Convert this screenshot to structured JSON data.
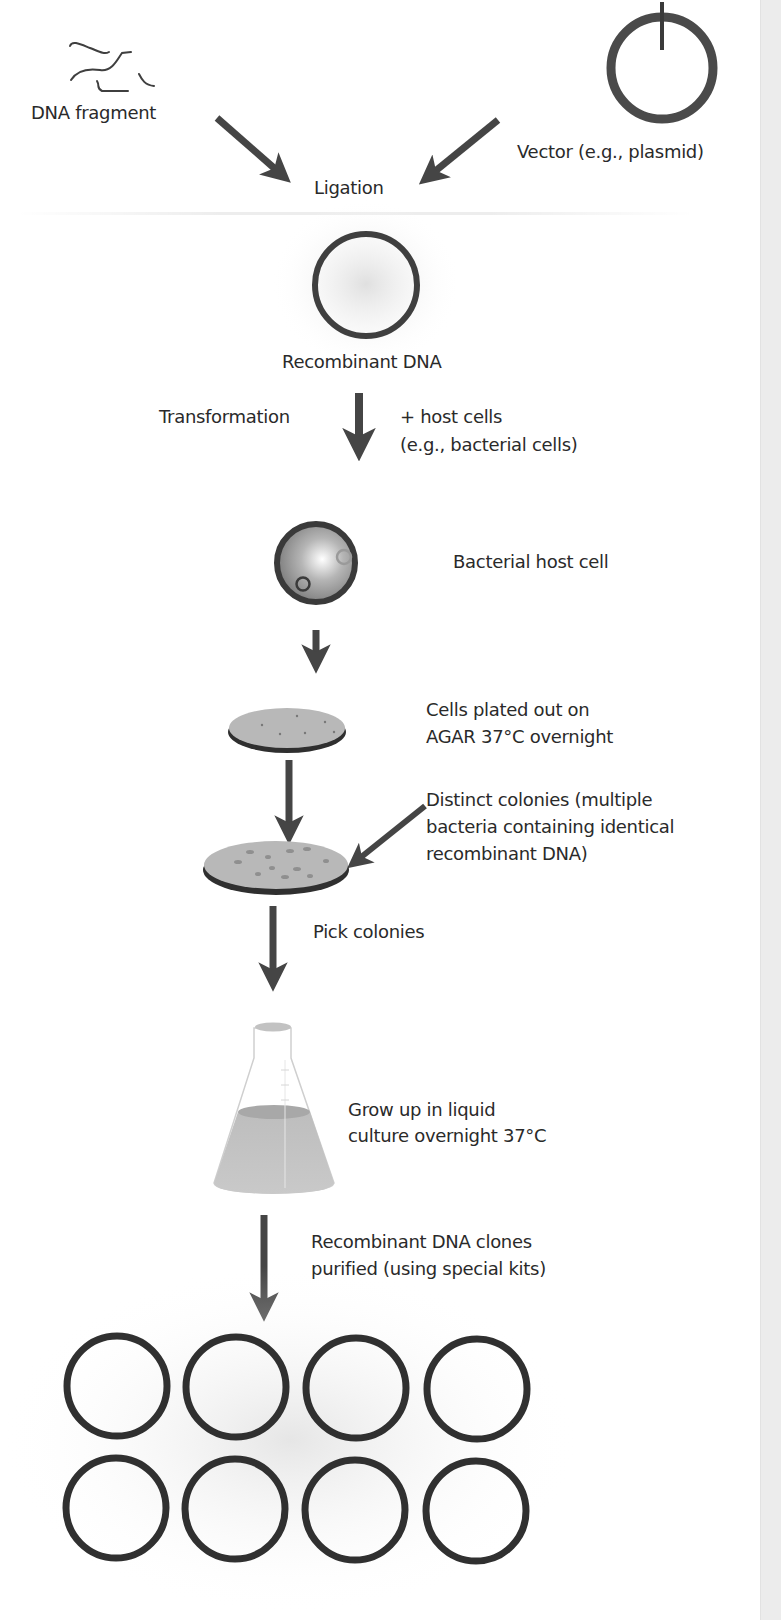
{
  "diagram": {
    "colors": {
      "stroke": "#3f3f3f",
      "arrow": "#454545",
      "agar": "#b8b8b8",
      "liquid": "#c4c4c4",
      "side_band": "#ececec"
    },
    "inputs": {
      "dna_fragment": "DNA fragment",
      "vector": "Vector (e.g., plasmid)"
    },
    "steps": [
      {
        "id": "ligation",
        "label": "Ligation"
      },
      {
        "id": "recombinant_dna",
        "label": "Recombinant DNA"
      },
      {
        "id": "transformation",
        "label": "Transformation",
        "note_line1": "+ host cells",
        "note_line2": "(e.g., bacterial cells)"
      },
      {
        "id": "host_cell",
        "label": "Bacterial host cell"
      },
      {
        "id": "plating",
        "line1": "Cells plated out on",
        "line2": "AGAR 37°C overnight"
      },
      {
        "id": "colonies",
        "line1": "Distinct colonies (multiple",
        "line2": "bacteria containing identical",
        "line3": "recombinant DNA)"
      },
      {
        "id": "pick",
        "label": "Pick colonies"
      },
      {
        "id": "culture",
        "line1": "Grow up in liquid",
        "line2": "culture overnight 37°C"
      },
      {
        "id": "purify",
        "line1": "Recombinant DNA clones",
        "line2": "purified (using special kits)"
      }
    ],
    "clone_grid": {
      "rows": 2,
      "cols": 4,
      "count": 8
    }
  }
}
